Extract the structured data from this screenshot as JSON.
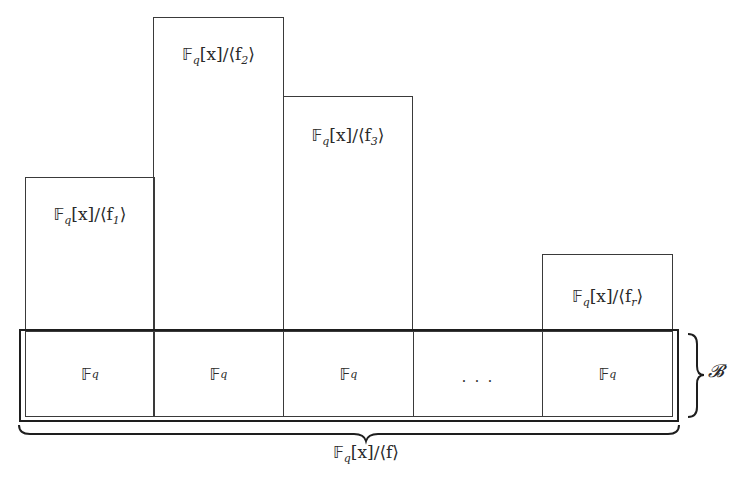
{
  "diagram": {
    "top_boxes": [
      {
        "id": "f1",
        "bb": "𝔽",
        "sub": "q",
        "mid": "[x]/⟨f",
        "index": "1",
        "end": "⟩"
      },
      {
        "id": "f2",
        "bb": "𝔽",
        "sub": "q",
        "mid": "[x]/⟨f",
        "index": "2",
        "end": "⟩"
      },
      {
        "id": "f3",
        "bb": "𝔽",
        "sub": "q",
        "mid": "[x]/⟨f",
        "index": "3",
        "end": "⟩"
      },
      {
        "id": "fr",
        "bb": "𝔽",
        "sub": "q",
        "mid": "[x]/⟨f",
        "index": "r",
        "end": "⟩"
      }
    ],
    "bottom_cells": [
      {
        "bb": "𝔽",
        "sub": "q"
      },
      {
        "bb": "𝔽",
        "sub": "q"
      },
      {
        "bb": "𝔽",
        "sub": "q"
      },
      {
        "text": "· · ·"
      },
      {
        "bb": "𝔽",
        "sub": "q"
      }
    ],
    "right_brace_label": "𝓑",
    "bottom_brace_label": {
      "bb": "𝔽",
      "sub": "q",
      "rest": "[x]/⟨f⟩"
    },
    "colors": {
      "line": "#3a3a3a",
      "outer_line": "#1e1e1e",
      "background": "#ffffff"
    }
  }
}
